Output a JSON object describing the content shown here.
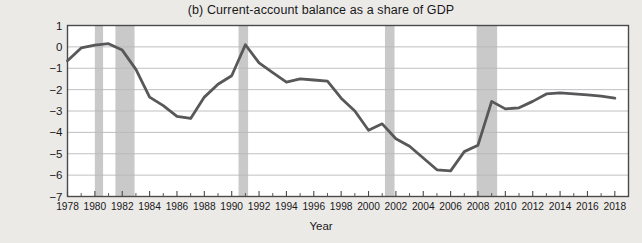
{
  "figure": {
    "panel_label": "(b)",
    "title": "(b) Current-account balance as a share of GDP",
    "ylabel_line1": "Current-account surplus (+)",
    "ylabel_line2": "or deficit (−) as a share of GDP",
    "xlabel": "Year",
    "background_color": "#eceae7",
    "plot_background_color": "#ffffff",
    "line_color": "#58585a",
    "gridline_color": "#b9b9bb",
    "recession_band_color": "#c9c9c9",
    "axis_color": "#4a4a4c"
  },
  "chart_data": {
    "type": "line",
    "title": "(b) Current-account balance as a share of GDP",
    "xlabel": "Year",
    "ylabel": "Current-account surplus (+) or deficit (−) as a share of GDP",
    "xlim": [
      1978,
      2019
    ],
    "ylim": [
      -7,
      1
    ],
    "ytick_labels": [
      "1",
      "0",
      "−1",
      "−2",
      "−3",
      "−4",
      "−5",
      "−6",
      "−7"
    ],
    "yticks": [
      1,
      0,
      -1,
      -2,
      -3,
      -4,
      -5,
      -6,
      -7
    ],
    "xtick_labels": [
      "1978",
      "1980",
      "1982",
      "1984",
      "1986",
      "1988",
      "1990",
      "1992",
      "1994",
      "1996",
      "1998",
      "2000",
      "2002",
      "2004",
      "2006",
      "2008",
      "2010",
      "2012",
      "2014",
      "2016",
      "2018"
    ],
    "xticks": [
      1978,
      1980,
      1982,
      1984,
      1986,
      1988,
      1990,
      1992,
      1994,
      1996,
      1998,
      2000,
      2002,
      2004,
      2006,
      2008,
      2010,
      2012,
      2014,
      2016,
      2018
    ],
    "xtick_minor_step": 1,
    "grid": "horizontal",
    "legend": "none",
    "series": [
      {
        "name": "Current-account balance (% of GDP)",
        "x": [
          1978,
          1979,
          1980,
          1981,
          1982,
          1983,
          1984,
          1985,
          1986,
          1987,
          1988,
          1989,
          1990,
          1991,
          1992,
          1993,
          1994,
          1995,
          1996,
          1997,
          1998,
          1999,
          2000,
          2001,
          2002,
          2003,
          2004,
          2005,
          2006,
          2007,
          2008,
          2009,
          2010,
          2011,
          2012,
          2013,
          2014,
          2015,
          2016,
          2017,
          2018
        ],
        "values": [
          -0.65,
          -0.05,
          0.08,
          0.15,
          -0.15,
          -1.05,
          -2.35,
          -2.75,
          -3.25,
          -3.35,
          -2.35,
          -1.75,
          -1.35,
          0.1,
          -0.75,
          -1.2,
          -1.65,
          -1.5,
          -1.55,
          -1.6,
          -2.4,
          -3.0,
          -3.9,
          -3.6,
          -4.3,
          -4.65,
          -5.2,
          -5.75,
          -5.8,
          -4.9,
          -4.6,
          -2.55,
          -2.9,
          -2.85,
          -2.55,
          -2.2,
          -2.15,
          -2.2,
          -2.25,
          -2.3,
          -2.4
        ]
      }
    ],
    "recession_bands": [
      {
        "start": 1980.0,
        "end": 1980.6
      },
      {
        "start": 1981.5,
        "end": 1982.9
      },
      {
        "start": 1990.5,
        "end": 1991.2
      },
      {
        "start": 2001.2,
        "end": 2001.9
      },
      {
        "start": 2007.9,
        "end": 2009.4
      }
    ]
  }
}
